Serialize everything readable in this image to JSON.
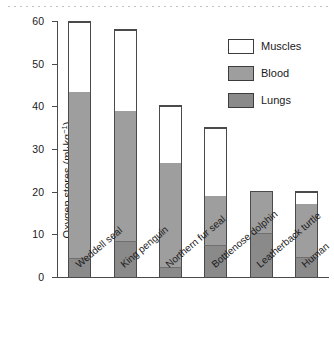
{
  "chart_data": {
    "type": "bar",
    "subtype": "stacked",
    "title": "",
    "xlabel": "",
    "ylabel": "Oxygen stores (ml·kg⁻¹)",
    "ylim": [
      0,
      60
    ],
    "yticks": [
      0,
      10,
      20,
      30,
      40,
      50,
      60
    ],
    "ytick_labels": [
      "0",
      "10",
      "20",
      "30",
      "40",
      "50",
      "60"
    ],
    "grid": false,
    "legend_position": "top-right",
    "categories": [
      "Weddell seal",
      "King penguin",
      "Northern fur seal",
      "Bottlenose dolphin",
      "Leatherback turtle",
      "Human"
    ],
    "series": [
      {
        "name": "Lungs",
        "color": "#8a8a8a",
        "values": [
          4.5,
          8.4,
          2.4,
          7.5,
          10.3,
          4.8
        ]
      },
      {
        "name": "Blood",
        "color": "#9e9e9e",
        "values": [
          38.8,
          30.6,
          24.4,
          11.5,
          9.7,
          12.2
        ]
      },
      {
        "name": "Muscles",
        "color": "#ffffff",
        "values": [
          16.5,
          19.0,
          13.2,
          16.0,
          0.0,
          3.0
        ]
      }
    ],
    "totals": [
      59.8,
      58.0,
      40.0,
      35.0,
      20.0,
      20.0
    ]
  },
  "axis": {
    "y_label_main": "Oxygen stores (ml·kg",
    "y_label_exp": "−1",
    "y_label_close": ")"
  },
  "legend": {
    "items": [
      {
        "label": "Muscles",
        "swatch": "legend-swatch-muscles"
      },
      {
        "label": "Blood",
        "swatch": "legend-swatch-blood"
      },
      {
        "label": "Lungs",
        "swatch": "legend-swatch-lungs"
      }
    ]
  }
}
